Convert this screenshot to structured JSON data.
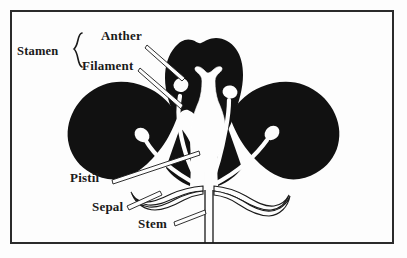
{
  "figure": {
    "kind": "botanical-diagram",
    "background_color": "#fdfdfd",
    "ink_color": "#111111",
    "border_color": "#2b2b2b"
  },
  "labels": {
    "stamen": "Stamen",
    "anther": "Anther",
    "filament": "Filament",
    "pistil": "Pistil",
    "sepal": "Sepal",
    "stem": "Stem"
  },
  "parts": [
    {
      "name": "petal-left",
      "fill": "#111111"
    },
    {
      "name": "petal-top",
      "fill": "#111111"
    },
    {
      "name": "petal-right",
      "fill": "#111111"
    },
    {
      "name": "pistil",
      "fill": "#fdfdfd"
    },
    {
      "name": "stamen",
      "fill": "#fdfdfd"
    },
    {
      "name": "anther",
      "fill": "#fdfdfd"
    },
    {
      "name": "sepal",
      "fill": "#fdfdfd"
    },
    {
      "name": "stem",
      "fill": "#fdfdfd"
    }
  ],
  "brace": {
    "glyph": "{",
    "groups": [
      "Anther",
      "Filament"
    ]
  }
}
